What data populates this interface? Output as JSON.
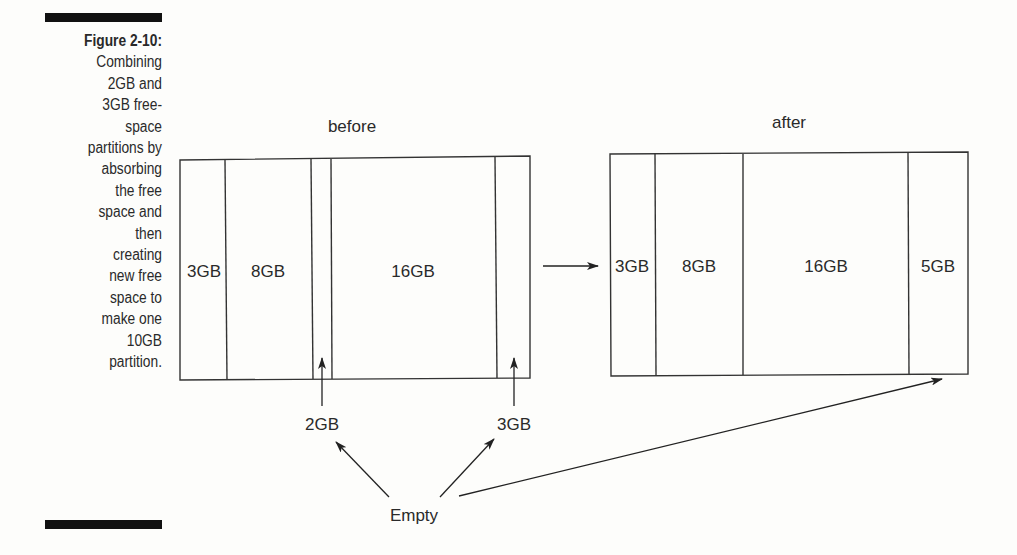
{
  "caption": {
    "figure_label": "Figure 2-10:",
    "lines": [
      "Combining",
      "2GB and",
      "3GB free-",
      "space",
      "partitions by",
      "absorbing",
      "the free",
      "space and",
      "then",
      "creating",
      "new free",
      "space to",
      "make one",
      "10GB",
      "partition."
    ]
  },
  "before": {
    "title": "before",
    "partitions": [
      {
        "label": "3GB",
        "type": "used"
      },
      {
        "label": "8GB",
        "type": "used"
      },
      {
        "label": "",
        "type": "empty",
        "size": "2GB"
      },
      {
        "label": "16GB",
        "type": "used"
      },
      {
        "label": "",
        "type": "empty",
        "size": "3GB"
      }
    ]
  },
  "after": {
    "title": "after",
    "partitions": [
      {
        "label": "3GB"
      },
      {
        "label": "8GB"
      },
      {
        "label": "16GB"
      },
      {
        "label": "5GB"
      }
    ]
  },
  "annotations": {
    "free_2gb": "2GB",
    "free_3gb": "3GB",
    "empty": "Empty"
  }
}
